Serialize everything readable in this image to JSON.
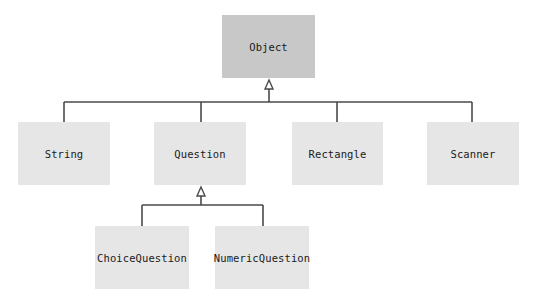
{
  "diagram": {
    "type": "uml-class-inheritance",
    "colors": {
      "root_fill": "#c8c8c8",
      "child_fill": "#e6e6e6",
      "line": "#4a4a4a",
      "text": "#1a1a1a"
    },
    "nodes": {
      "object": {
        "label": "Object",
        "parent": null
      },
      "string": {
        "label": "String",
        "parent": "Object"
      },
      "question": {
        "label": "Question",
        "parent": "Object"
      },
      "rectangle": {
        "label": "Rectangle",
        "parent": "Object"
      },
      "scanner": {
        "label": "Scanner",
        "parent": "Object"
      },
      "choice_question": {
        "label": "ChoiceQuestion",
        "parent": "Question"
      },
      "numeric_question": {
        "label": "NumericQuestion",
        "parent": "Question"
      }
    },
    "edges": [
      {
        "from": "String",
        "to": "Object",
        "kind": "inheritance"
      },
      {
        "from": "Question",
        "to": "Object",
        "kind": "inheritance"
      },
      {
        "from": "Rectangle",
        "to": "Object",
        "kind": "inheritance"
      },
      {
        "from": "Scanner",
        "to": "Object",
        "kind": "inheritance"
      },
      {
        "from": "ChoiceQuestion",
        "to": "Question",
        "kind": "inheritance"
      },
      {
        "from": "NumericQuestion",
        "to": "Question",
        "kind": "inheritance"
      }
    ]
  }
}
